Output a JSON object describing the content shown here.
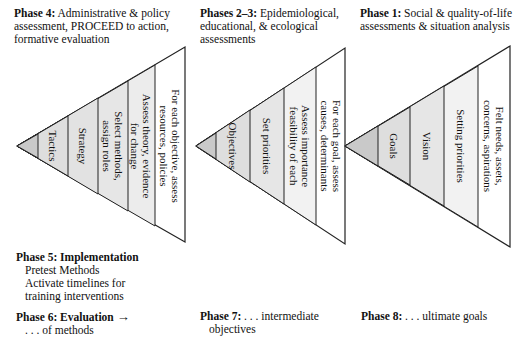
{
  "phase_headers": {
    "phase4": {
      "title": "Phase 4:",
      "text": "Administrative & policy assessment, PROCEED to action, formative evaluation"
    },
    "phase23": {
      "title": "Phases 2–3:",
      "text": "Epidemiological, educational, & ecological assessments"
    },
    "phase1": {
      "title": "Phase 1:",
      "text": "Social & quality-of-life assessments & situation analysis"
    }
  },
  "triangles": [
    {
      "name": "phase4-triangle",
      "bands": [
        {
          "lines": [
            "Tactics"
          ]
        },
        {
          "lines": [
            "Strategy"
          ]
        },
        {
          "lines": [
            "Select methods,",
            "assign roles"
          ]
        },
        {
          "lines": [
            "Assess theory, evidence",
            "for change"
          ]
        },
        {
          "lines": [
            "For each objective, assess",
            "resources, policies"
          ]
        }
      ]
    },
    {
      "name": "phase23-triangle",
      "bands": [
        {
          "lines": [
            "Objectives"
          ]
        },
        {
          "lines": [
            "Set priorities"
          ]
        },
        {
          "lines": [
            "Assess importance",
            "feasibility of each"
          ]
        },
        {
          "lines": [
            "For each goal, assess",
            "causes, determinants"
          ]
        }
      ]
    },
    {
      "name": "phase1-triangle",
      "bands": [
        {
          "lines": [
            "Goals"
          ]
        },
        {
          "lines": [
            "Vision"
          ]
        },
        {
          "lines": [
            "Setting priorities"
          ]
        },
        {
          "lines": [
            "Felt needs, assets,",
            "concerns, aspirations"
          ]
        }
      ]
    }
  ],
  "phase5": {
    "title": "Phase 5: Implementation",
    "items": [
      "Pretest Methods",
      "Activate timelines for",
      "training interventions"
    ]
  },
  "phase6": {
    "title": "Phase 6: Evaluation",
    "arrow": "→",
    "text": ". . . of methods"
  },
  "phase7": {
    "title": "Phase 7:",
    "text": ". . . intermediate",
    "text2": "objectives"
  },
  "phase8": {
    "title": "Phase 8:",
    "text": ". . . ultimate goals"
  },
  "colors": {
    "tip": "#c9c9c9",
    "band_mid": "#dedede",
    "band_light": "#ececec",
    "band_outer": "#ffffff",
    "stroke": "#222222"
  }
}
